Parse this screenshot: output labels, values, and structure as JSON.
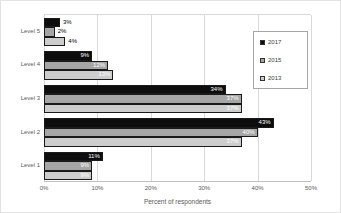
{
  "chart_data": {
    "type": "bar",
    "orientation": "horizontal",
    "xlabel": "Percent of respondents",
    "xlim": [
      0,
      50
    ],
    "x_ticks": [
      "0%",
      "10%",
      "20%",
      "30%",
      "40%",
      "50%"
    ],
    "grid": true,
    "legend_position": "upper-right",
    "categories": [
      "Level 5",
      "Level 4",
      "Level 3",
      "Level 2",
      "Level 1"
    ],
    "series": [
      {
        "name": "2017",
        "color": "#0d0d0d",
        "values": [
          3,
          9,
          34,
          43,
          11
        ]
      },
      {
        "name": "2015",
        "color": "#a6a6a6",
        "values": [
          2,
          12,
          37,
          40,
          9
        ]
      },
      {
        "name": "2013",
        "color": "#cdcdcd",
        "values": [
          4,
          13,
          37,
          37,
          9
        ]
      }
    ],
    "data_labels": {
      "format": "percent",
      "inside_color": "#ffffff",
      "outside_color": "#000000"
    }
  },
  "styles": {
    "grid_color": "#d9d9d9",
    "axis_line_color": "#bfbfbf",
    "bar_border_color": "#1a1a1a",
    "tick_text_color": "#595959",
    "legend_border_color": "#a6a6a6",
    "background": "#ffffff"
  }
}
